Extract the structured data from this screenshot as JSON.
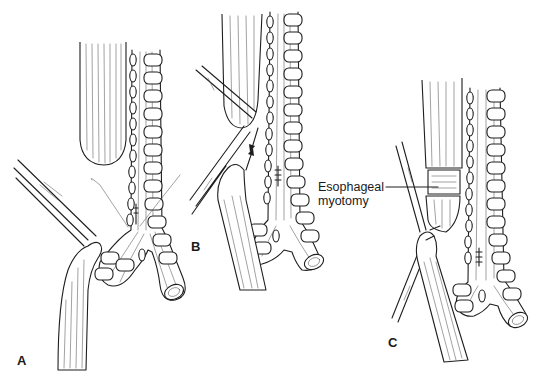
{
  "figure": {
    "background_color": "#ffffff",
    "ink_color": "#1e1e1e"
  },
  "panels": [
    {
      "id": "A",
      "label": "A",
      "content": "Upper esophageal pouch above trachea; fistula ligated with sutures on trachea; lower esophagus held by forceps"
    },
    {
      "id": "B",
      "label": "B",
      "content": "Upper pouch and lower esophagus approximated with forceps; arrows indicate stretching toward each other; sutured fistula site on trachea"
    },
    {
      "id": "C",
      "label": "C",
      "content": "Upper pouch with circular esophageal myotomy, anastomosed to lower esophagus held by forceps"
    }
  ],
  "annotations": {
    "myotomy_label_line1": "Esophageal",
    "myotomy_label_line2": "myotomy"
  },
  "icons": {
    "arrow_down": "arrow-down-icon",
    "arrow_up": "arrow-up-icon"
  }
}
